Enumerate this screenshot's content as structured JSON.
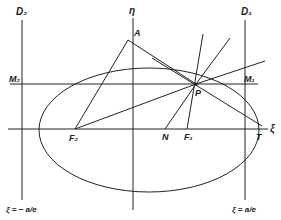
{
  "diagram": {
    "labels": {
      "D2": "D₂",
      "D1": "D₁",
      "eta": "η",
      "xi": "ξ",
      "A": "A",
      "M2": "M₂",
      "M1": "M₁",
      "P": "P",
      "F2": "F₂",
      "F1": "F₁",
      "N": "N",
      "T": "T",
      "left_directrix_eq": "ξ = − a/e",
      "right_directrix_eq": "ξ = a/e"
    },
    "colors": {
      "line": "#222222",
      "background": "#ffffff"
    }
  }
}
